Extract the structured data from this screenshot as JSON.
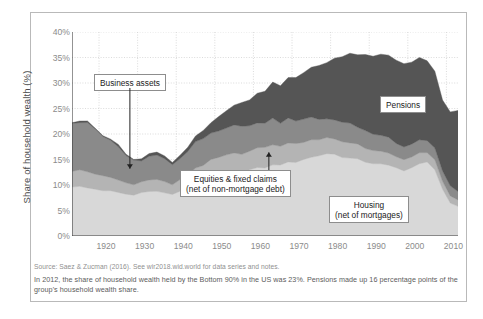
{
  "chart_data": {
    "type": "area",
    "title": "",
    "xlabel": "",
    "ylabel": "Share of household wealth (%)",
    "xlim": [
      1913,
      2013
    ],
    "ylim": [
      0,
      40
    ],
    "grid": true,
    "stacked": true,
    "legend_position": "inline-callouts",
    "xticks": [
      "1920",
      "1930",
      "1940",
      "1950",
      "1960",
      "1970",
      "1980",
      "1990",
      "2000",
      "2010"
    ],
    "xtick_values": [
      1920,
      1930,
      1940,
      1950,
      1960,
      1970,
      1980,
      1990,
      2000,
      2010
    ],
    "yticks": [
      "0%",
      "5%",
      "10%",
      "15%",
      "20%",
      "25%",
      "30%",
      "35%",
      "40%"
    ],
    "ytick_values": [
      0,
      5,
      10,
      15,
      20,
      25,
      30,
      35,
      40
    ],
    "x": [
      1913,
      1915,
      1917,
      1919,
      1921,
      1923,
      1925,
      1927,
      1929,
      1931,
      1933,
      1935,
      1937,
      1939,
      1941,
      1943,
      1945,
      1947,
      1949,
      1951,
      1953,
      1955,
      1957,
      1959,
      1961,
      1963,
      1965,
      1967,
      1969,
      1971,
      1973,
      1975,
      1977,
      1979,
      1981,
      1983,
      1985,
      1987,
      1989,
      1991,
      1993,
      1995,
      1997,
      1999,
      2001,
      2003,
      2005,
      2007,
      2009,
      2011,
      2013
    ],
    "series": [
      {
        "name": "Housing (net of mortgages)",
        "color": "#d8d8d8",
        "values": [
          9.8,
          9.6,
          9.4,
          9.2,
          9.0,
          8.7,
          8.4,
          8.2,
          8.0,
          8.5,
          9.0,
          8.7,
          8.4,
          8.2,
          8.6,
          9.4,
          10.2,
          10.8,
          11.3,
          11.8,
          12.1,
          12.4,
          12.6,
          12.9,
          13.2,
          13.5,
          13.8,
          14.1,
          14.3,
          14.6,
          15.1,
          15.4,
          15.8,
          16.2,
          16.0,
          15.6,
          15.2,
          14.9,
          14.6,
          14.3,
          14.0,
          13.7,
          13.3,
          13.0,
          13.4,
          14.0,
          14.4,
          13.2,
          9.2,
          6.2,
          5.6
        ]
      },
      {
        "name": "Equities & fixed claims (net of non-mortgage debt)",
        "color": "#b4b4b4",
        "values": [
          3.2,
          3.4,
          3.2,
          3.0,
          2.8,
          2.6,
          2.4,
          2.2,
          2.0,
          2.1,
          2.3,
          2.2,
          2.1,
          2.0,
          2.2,
          2.6,
          3.0,
          3.2,
          3.3,
          3.5,
          3.6,
          3.7,
          3.8,
          3.8,
          3.9,
          3.9,
          3.9,
          3.8,
          3.7,
          3.6,
          3.5,
          3.4,
          3.3,
          3.2,
          3.1,
          3.0,
          2.9,
          2.8,
          2.7,
          2.6,
          2.5,
          2.4,
          2.3,
          2.2,
          2.1,
          2.0,
          1.9,
          1.8,
          1.5,
          1.3,
          1.2
        ]
      },
      {
        "name": "Business assets",
        "color": "#8a8a8a",
        "values": [
          9.6,
          9.3,
          9.8,
          8.6,
          7.6,
          7.0,
          6.4,
          5.6,
          4.6,
          4.4,
          4.8,
          4.6,
          4.4,
          4.2,
          4.4,
          4.8,
          5.2,
          5.3,
          5.4,
          5.5,
          5.5,
          5.4,
          5.3,
          5.2,
          5.1,
          5.0,
          4.9,
          4.8,
          4.7,
          4.5,
          4.4,
          4.2,
          4.0,
          3.9,
          3.8,
          3.7,
          3.6,
          3.5,
          3.4,
          3.3,
          3.2,
          3.0,
          2.9,
          2.8,
          2.7,
          2.6,
          2.5,
          2.4,
          2.1,
          1.9,
          1.8
        ]
      },
      {
        "name": "Pensions",
        "color": "#555555",
        "values": [
          0.2,
          0.2,
          0.3,
          0.3,
          0.3,
          0.3,
          0.3,
          0.3,
          0.3,
          0.4,
          0.5,
          0.5,
          0.5,
          0.6,
          0.7,
          0.9,
          1.2,
          1.6,
          2.1,
          2.7,
          3.3,
          3.9,
          4.5,
          5.1,
          5.7,
          6.3,
          6.9,
          7.4,
          7.9,
          8.5,
          9.2,
          9.8,
          10.4,
          11.2,
          12.0,
          12.8,
          13.6,
          14.3,
          14.9,
          15.4,
          15.8,
          16.1,
          16.3,
          16.4,
          16.2,
          16.0,
          15.6,
          15.0,
          14.0,
          14.6,
          16.0
        ]
      }
    ],
    "annotations": [
      {
        "id": "business-assets",
        "label": "Business assets",
        "lines": [
          "Business assets"
        ]
      },
      {
        "id": "equities",
        "label": "Equities & fixed claims (net of non-mortgage debt)",
        "lines": [
          "Equities & fixed claims",
          "(net of non-mortgage debt)"
        ]
      },
      {
        "id": "housing",
        "label": "Housing (net of mortgages)",
        "lines": [
          "Housing",
          "(net of mortgages)"
        ]
      },
      {
        "id": "pensions",
        "label": "Pensions",
        "lines": [
          "Pensions"
        ]
      }
    ]
  },
  "footer": {
    "source": "Source: Saez & Zucman (2016). See wir2018.wid.world for data series and notes.",
    "note": "In 2012, the share of household wealth held by the Bottom 90% in the US was 23%. Pensions made up 16 percentage points of the group's household wealth share."
  }
}
